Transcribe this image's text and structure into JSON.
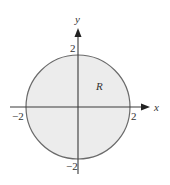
{
  "diagram": {
    "type": "region-disk",
    "axes": {
      "x_label": "x",
      "y_label": "y"
    },
    "ticks": {
      "x_neg": "−2",
      "x_pos": "2",
      "y_pos": "2",
      "y_neg": "−2"
    },
    "region_label": "R",
    "circle": {
      "center": [
        0,
        0
      ],
      "radius": 2
    },
    "colors": {
      "fill": "#ececec",
      "stroke": "#6a6a6a",
      "axis": "#3a3a3a"
    }
  }
}
